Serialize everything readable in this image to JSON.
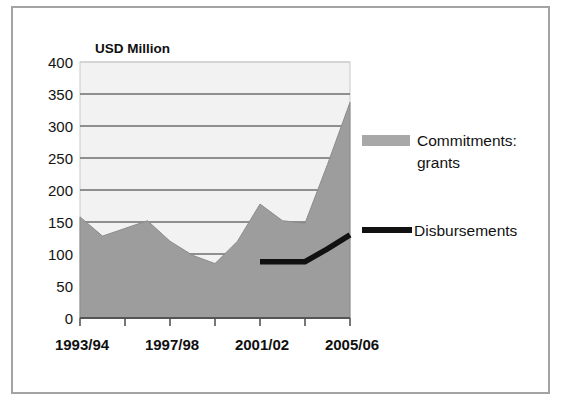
{
  "figure": {
    "border_color": "#a3a3a3",
    "background": "#ffffff"
  },
  "chart_data": {
    "type": "area",
    "title": "",
    "axis_title": "USD Million",
    "xlabel": "",
    "ylabel": "USD Million",
    "ylim": [
      0,
      400
    ],
    "yticks": [
      0,
      50,
      100,
      150,
      200,
      250,
      300,
      350,
      400
    ],
    "ytick_labels": [
      "0",
      "50",
      "100",
      "150",
      "200",
      "250",
      "300",
      "350",
      "400"
    ],
    "grid": true,
    "grid_axis": "y",
    "legend_position": "right",
    "x": [
      "1993/94",
      "1994/95",
      "1995/96",
      "1996/97",
      "1997/98",
      "1998/99",
      "1999/00",
      "2000/01",
      "2001/02",
      "2002/03",
      "2003/04",
      "2004/05",
      "2005/06"
    ],
    "xtick_labels_shown": [
      "1993/94",
      "1997/98",
      "2001/02",
      "2005/06"
    ],
    "xtick_label_indices": [
      0,
      4,
      8,
      12
    ],
    "series": [
      {
        "name": "Commitments: grants",
        "type": "area",
        "color": "#9d9d9d",
        "values": [
          158,
          128,
          140,
          152,
          120,
          98,
          85,
          120,
          178,
          152,
          148,
          240,
          337
        ]
      },
      {
        "name": "Disbursements",
        "type": "line",
        "color": "#111111",
        "x_start_index": 8,
        "values": [
          null,
          null,
          null,
          null,
          null,
          null,
          null,
          null,
          88,
          88,
          88,
          108,
          130
        ]
      }
    ],
    "legend_entries": [
      {
        "label_line1": "Commitments:",
        "label_line2": "grants",
        "marker": "swatch",
        "color": "#a8a8a8"
      },
      {
        "label_line1": "Disbursements",
        "label_line2": "",
        "marker": "line",
        "color": "#111111"
      }
    ]
  }
}
